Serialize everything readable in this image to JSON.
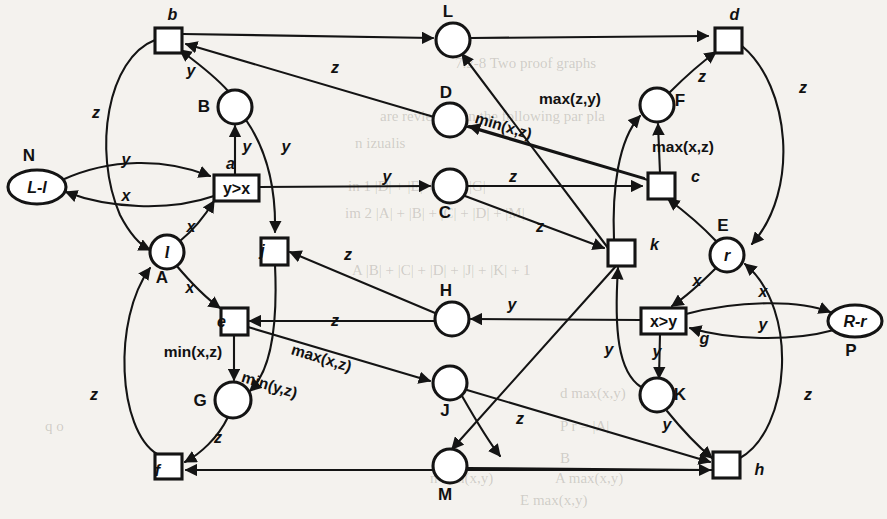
{
  "diagram": {
    "places": [
      {
        "id": "N",
        "label": "N",
        "inner": "L-l",
        "shape": "ellipse",
        "cx": 37,
        "cy": 187,
        "rx": 29,
        "ry": 17,
        "tag_dx": -8,
        "tag_dy": -26
      },
      {
        "id": "B",
        "label": "B",
        "inner": "",
        "shape": "circle",
        "cx": 235,
        "cy": 107,
        "rx": 17,
        "ry": 17,
        "tag_dx": -31,
        "tag_dy": 5
      },
      {
        "id": "A",
        "label": "A",
        "inner": "l",
        "shape": "circle",
        "cx": 167,
        "cy": 252,
        "rx": 17,
        "ry": 17,
        "tag_dx": -5,
        "tag_dy": 31
      },
      {
        "id": "L",
        "label": "L",
        "inner": "",
        "shape": "circle",
        "cx": 453,
        "cy": 40,
        "rx": 17,
        "ry": 17,
        "tag_dx": -5,
        "tag_dy": -23
      },
      {
        "id": "D",
        "label": "D",
        "inner": "",
        "shape": "circle",
        "cx": 450,
        "cy": 120,
        "rx": 17,
        "ry": 17,
        "tag_dx": -4,
        "tag_dy": -22
      },
      {
        "id": "C",
        "label": "C",
        "inner": "",
        "shape": "circle",
        "cx": 450,
        "cy": 186,
        "rx": 17,
        "ry": 17,
        "tag_dx": -5,
        "tag_dy": 32
      },
      {
        "id": "H",
        "label": "H",
        "inner": "",
        "shape": "circle",
        "cx": 452,
        "cy": 319,
        "rx": 17,
        "ry": 17,
        "tag_dx": -6,
        "tag_dy": -23
      },
      {
        "id": "G",
        "label": "G",
        "inner": "",
        "shape": "circle",
        "cx": 233,
        "cy": 400,
        "rx": 18,
        "ry": 18,
        "tag_dx": -33,
        "tag_dy": 6
      },
      {
        "id": "J",
        "label": "J",
        "inner": "",
        "shape": "circle",
        "cx": 450,
        "cy": 383,
        "rx": 17,
        "ry": 17,
        "tag_dx": -5,
        "tag_dy": 33
      },
      {
        "id": "M",
        "label": "M",
        "inner": "",
        "shape": "circle",
        "cx": 450,
        "cy": 466,
        "rx": 17,
        "ry": 17,
        "tag_dx": -5,
        "tag_dy": 34
      },
      {
        "id": "F",
        "label": "F",
        "inner": "",
        "shape": "circle",
        "cx": 657,
        "cy": 105,
        "rx": 17,
        "ry": 17,
        "tag_dx": 23,
        "tag_dy": 1
      },
      {
        "id": "E",
        "label": "E",
        "inner": "r",
        "shape": "circle",
        "cx": 727,
        "cy": 255,
        "rx": 17,
        "ry": 17,
        "tag_dx": -4,
        "tag_dy": -24
      },
      {
        "id": "K",
        "label": "K",
        "inner": "",
        "shape": "circle",
        "cx": 657,
        "cy": 395,
        "rx": 17,
        "ry": 17,
        "tag_dx": 23,
        "tag_dy": 5
      },
      {
        "id": "P",
        "label": "P",
        "inner": "R-r",
        "shape": "ellipse",
        "cx": 855,
        "cy": 321,
        "rx": 27,
        "ry": 16,
        "tag_dx": -4,
        "tag_dy": 35
      }
    ],
    "transitions": [
      {
        "id": "b",
        "label": "b",
        "inner": "",
        "x": 155,
        "y": 28,
        "w": 27,
        "h": 25,
        "tag_dx": 4,
        "tag_dy": -8
      },
      {
        "id": "a",
        "label": "a",
        "inner": "y>x",
        "x": 214,
        "y": 175,
        "w": 45,
        "h": 26,
        "tag_dx": -6,
        "tag_dy": -6
      },
      {
        "id": "j",
        "label": "j",
        "inner": "",
        "x": 261,
        "y": 238,
        "w": 27,
        "h": 27,
        "tag_dx": -12,
        "tag_dy": 18
      },
      {
        "id": "e",
        "label": "e",
        "inner": "",
        "x": 221,
        "y": 308,
        "w": 27,
        "h": 27,
        "tag_dx": -13,
        "tag_dy": 19
      },
      {
        "id": "f",
        "label": "f",
        "inner": "",
        "x": 155,
        "y": 454,
        "w": 27,
        "h": 25,
        "tag_dx": -11,
        "tag_dy": 22
      },
      {
        "id": "d",
        "label": "d",
        "inner": "",
        "x": 715,
        "y": 28,
        "w": 27,
        "h": 25,
        "tag_dx": 6,
        "tag_dy": -8
      },
      {
        "id": "c",
        "label": "c",
        "inner": "",
        "x": 648,
        "y": 173,
        "w": 27,
        "h": 26,
        "tag_dx": 34,
        "tag_dy": 9
      },
      {
        "id": "k",
        "label": "k",
        "inner": "",
        "x": 608,
        "y": 240,
        "w": 27,
        "h": 26,
        "tag_dx": 33,
        "tag_dy": 10
      },
      {
        "id": "g",
        "label": "g",
        "inner": "x>y",
        "x": 641,
        "y": 308,
        "w": 45,
        "h": 26,
        "tag_dx": 41,
        "tag_dy": 36
      },
      {
        "id": "h",
        "label": "h",
        "inner": "",
        "x": 713,
        "y": 452,
        "w": 27,
        "h": 26,
        "tag_dx": 33,
        "tag_dy": 23
      }
    ],
    "arc_labels": [
      {
        "text": "y",
        "x": 191,
        "y": 76,
        "style": "var"
      },
      {
        "text": "z",
        "x": 96,
        "y": 118,
        "style": "var"
      },
      {
        "text": "z",
        "x": 335,
        "y": 73,
        "style": "var"
      },
      {
        "text": "y",
        "x": 126,
        "y": 165,
        "style": "var"
      },
      {
        "text": "x",
        "x": 126,
        "y": 201,
        "style": "var"
      },
      {
        "text": "y",
        "x": 247,
        "y": 152,
        "style": "var"
      },
      {
        "text": "y",
        "x": 286,
        "y": 152,
        "style": "var"
      },
      {
        "text": "x",
        "x": 191,
        "y": 232,
        "style": "var"
      },
      {
        "text": "x",
        "x": 190,
        "y": 293,
        "style": "var"
      },
      {
        "text": "y",
        "x": 387,
        "y": 182,
        "style": "var"
      },
      {
        "text": "z",
        "x": 513,
        "y": 182,
        "style": "var"
      },
      {
        "text": "z",
        "x": 540,
        "y": 232,
        "style": "var"
      },
      {
        "text": "z",
        "x": 348,
        "y": 260,
        "style": "var"
      },
      {
        "text": "z",
        "x": 335,
        "y": 326,
        "style": "var"
      },
      {
        "text": "y",
        "x": 512,
        "y": 310,
        "style": "var"
      },
      {
        "text": "min(x,z)",
        "x": 193,
        "y": 357,
        "style": "fn"
      },
      {
        "text": "min(y,z)",
        "x": 268,
        "y": 390,
        "style": "fn-rot"
      },
      {
        "text": "max(x,z)",
        "x": 320,
        "y": 363,
        "style": "fn-rot"
      },
      {
        "text": "z",
        "x": 94,
        "y": 400,
        "style": "var"
      },
      {
        "text": "z",
        "x": 218,
        "y": 443,
        "style": "var"
      },
      {
        "text": "z",
        "x": 520,
        "y": 424,
        "style": "var"
      },
      {
        "text": "min(x,z)",
        "x": 502,
        "y": 131,
        "style": "fn-rot"
      },
      {
        "text": "max(z,y)",
        "x": 570,
        "y": 104,
        "style": "fn"
      },
      {
        "text": "max(x,z)",
        "x": 683,
        "y": 152,
        "style": "fn"
      },
      {
        "text": "z",
        "x": 702,
        "y": 82,
        "style": "var"
      },
      {
        "text": "z",
        "x": 803,
        "y": 93,
        "style": "var"
      },
      {
        "text": "x",
        "x": 697,
        "y": 286,
        "style": "var"
      },
      {
        "text": "x",
        "x": 763,
        "y": 297,
        "style": "var"
      },
      {
        "text": "y",
        "x": 763,
        "y": 330,
        "style": "var"
      },
      {
        "text": "y",
        "x": 609,
        "y": 355,
        "style": "var"
      },
      {
        "text": "y",
        "x": 657,
        "y": 357,
        "style": "var"
      },
      {
        "text": "y",
        "x": 667,
        "y": 430,
        "style": "var"
      },
      {
        "text": "z",
        "x": 808,
        "y": 400,
        "style": "var"
      }
    ],
    "background_text": [
      {
        "text": "7.2-8      Two proof graphs",
        "x": 455,
        "y": 55
      },
      {
        "text": "are reviewed on the following par pla",
        "x": 380,
        "y": 108
      },
      {
        "text": "n izualis",
        "x": 355,
        "y": 135
      },
      {
        "text": "in 1  |D| + |E| + |F| + |G|",
        "x": 348,
        "y": 178
      },
      {
        "text": "im  2   |A| + |B| + |C| + |D| + |M|",
        "x": 345,
        "y": 205
      },
      {
        "text": "A |B| + |C| + |D| + |J| + |K| + 1",
        "x": 352,
        "y": 262
      },
      {
        "text": "d max(x,y)",
        "x": 560,
        "y": 385
      },
      {
        "text": "|P|",
        "x": 640,
        "y": 392
      },
      {
        "text": "P  r = |A|",
        "x": 560,
        "y": 418
      },
      {
        "text": "q  o",
        "x": 45,
        "y": 418
      },
      {
        "text": "B",
        "x": 560,
        "y": 450
      },
      {
        "text": "A max(x,y)",
        "x": 555,
        "y": 470
      },
      {
        "text": "n       min(x,y)",
        "x": 430,
        "y": 470
      },
      {
        "text": "E max(x,y)",
        "x": 520,
        "y": 492
      }
    ]
  }
}
